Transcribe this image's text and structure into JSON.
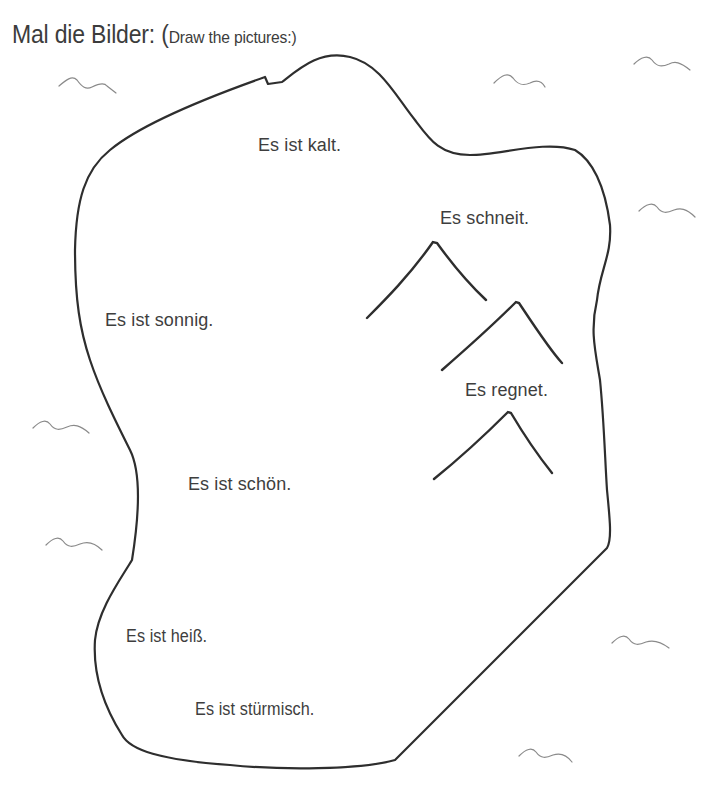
{
  "title": {
    "main": "Mal die Bilder: ",
    "paren_open": "(",
    "subtitle": "Draw the pictures:)"
  },
  "phrases": [
    {
      "id": "kalt",
      "text": "Es ist kalt."
    },
    {
      "id": "schneit",
      "text": "Es schneit."
    },
    {
      "id": "sonnig",
      "text": "Es ist sonnig."
    },
    {
      "id": "regnet",
      "text": "Es regnet."
    },
    {
      "id": "schoen",
      "text": "Es ist schön."
    },
    {
      "id": "heiss",
      "text": "Es ist heiß."
    },
    {
      "id": "stuermisch",
      "text": "Es ist stürmisch."
    }
  ],
  "drawings": {
    "outline": "island-shaped drawing area",
    "mountains": 3,
    "birds": 9
  },
  "colors": {
    "ink": "#2e2e2e",
    "text": "#3e3e3e",
    "bird": "#8a8a8a",
    "background": "#ffffff"
  }
}
